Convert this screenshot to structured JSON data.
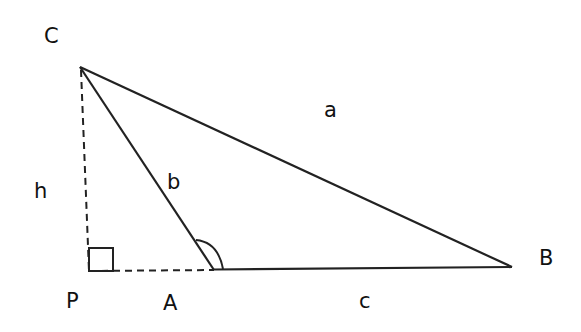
{
  "diagram": {
    "type": "triangle-obtuse-with-altitude",
    "vertices": {
      "C": {
        "label": "C"
      },
      "A": {
        "label": "A"
      },
      "B": {
        "label": "B"
      },
      "P": {
        "label": "P"
      }
    },
    "sides": {
      "a": {
        "label": "a",
        "from": "C",
        "to": "B"
      },
      "b": {
        "label": "b",
        "from": "C",
        "to": "A"
      },
      "c": {
        "label": "c",
        "from": "A",
        "to": "B"
      }
    },
    "altitude": {
      "label": "h",
      "from": "C",
      "to": "P",
      "style": "dashed"
    },
    "extension": {
      "from": "P",
      "to": "A",
      "style": "dashed"
    },
    "markers": {
      "right_angle_at": "P",
      "angle_arc_at": "A"
    },
    "stroke_color": "#222222"
  }
}
